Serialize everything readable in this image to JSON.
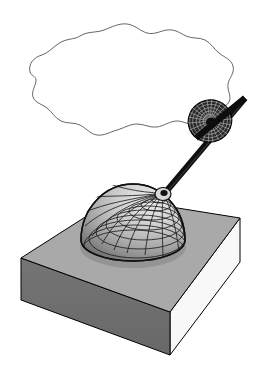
{
  "figure": {
    "title": "",
    "caption": "",
    "background_color": "#ffffff",
    "width": 257,
    "height": 387
  },
  "objects": {
    "cloud": {
      "name": "cloud-outline",
      "label": "",
      "stroke_color": "#555555",
      "fill_color": "#ffffff",
      "stroke_width": 0.9,
      "path": "M 30,72 C 28,64 34,57 42,55 C 48,53 52,48 58,44 C 66,38 74,40 80,36 C 88,31 96,33 104,30 C 112,27 119,23 127,24 C 135,25 140,31 147,33 C 154,35 160,31 167,30 C 175,29 180,33 186,36 C 192,39 199,37 205,40 C 211,43 214,49 219,53 C 225,58 231,59 233,66 C 235,73 229,78 228,84 C 227,91 232,96 229,102 C 226,108 218,107 212,111 C 206,115 204,122 197,124 C 190,126 184,121 177,121 C 170,121 164,126 157,127 C 150,128 144,124 137,124 C 130,124 124,128 117,130 C 110,132 104,136 97,135 C 90,134 86,128 80,125 C 74,122 67,124 61,121 C 55,118 52,112 47,108 C 42,104 35,103 33,97 C 31,91 36,86 36,80 C 36,76 31,76 30,72 Z"
    },
    "slab": {
      "name": "base-slab",
      "label": "",
      "top_face_color": "#a9a9a9",
      "front_face_color": "#6e6e6e",
      "right_face_color": "#f7f7f7",
      "edge_color": "#000000",
      "corners": {
        "top_left": [
          21,
          258
        ],
        "top_back": [
          115,
          198
        ],
        "top_right": [
          240,
          218
        ],
        "top_front": [
          170,
          312
        ],
        "bottom_left": [
          21,
          300
        ],
        "bottom_front": [
          170,
          355
        ],
        "bottom_right": [
          240,
          262
        ]
      }
    },
    "dome": {
      "name": "gridded-dome",
      "label": "",
      "type": "hemisphere-mesh",
      "center": [
        133,
        232
      ],
      "radius_x": 52,
      "radius_y": 56,
      "grid_color": "#1a1a1a",
      "light_color": "#e9e9e9",
      "dark_color": "#6f6f6f",
      "meridians": 24,
      "parallels": 9,
      "pole": [
        163,
        193
      ]
    },
    "rod": {
      "name": "connecting-rod",
      "label": "",
      "color": "#111111",
      "width": 6,
      "start": [
        164,
        194
      ],
      "end": [
        245,
        98
      ]
    },
    "disc": {
      "name": "meshed-disc",
      "label": "",
      "type": "ellipse-mesh",
      "center": [
        210,
        121
      ],
      "radius_x": 22,
      "radius_y": 21,
      "rotation_deg": -24,
      "fill_color": "#2a2a2a",
      "grid_color": "#cfcfcf",
      "rings": 7,
      "spokes": 36
    }
  }
}
